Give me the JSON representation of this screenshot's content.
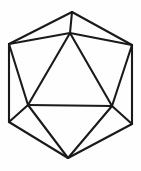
{
  "figure": {
    "name": "icosahedron-wireframe",
    "shape_type": "polyhedron-wireframe",
    "background_color": "#fefefe",
    "line_color": "#1a1a1a",
    "line_width": 2.1,
    "canvas": {
      "width": 141,
      "height": 171
    },
    "vertices": [
      {
        "id": "top-apex",
        "label": "top apex",
        "x": 72,
        "y": 12
      },
      {
        "id": "inner-top",
        "label": "inner top",
        "x": 70,
        "y": 33
      },
      {
        "id": "hex-top-left",
        "label": "hexagon top left",
        "x": 9,
        "y": 44
      },
      {
        "id": "hex-top-right",
        "label": "hexagon top right",
        "x": 132,
        "y": 45
      },
      {
        "id": "inner-left",
        "label": "inner left",
        "x": 28,
        "y": 105
      },
      {
        "id": "inner-right",
        "label": "inner right",
        "x": 112,
        "y": 106
      },
      {
        "id": "hex-bot-left",
        "label": "hexagon bottom left",
        "x": 9,
        "y": 122
      },
      {
        "id": "hex-bot-right",
        "label": "hexagon bottom right",
        "x": 132,
        "y": 124
      },
      {
        "id": "bottom-apex",
        "label": "bottom apex",
        "x": 68,
        "y": 158
      }
    ],
    "edges": [
      {
        "id": "outline-top-left",
        "from": "top-apex",
        "to": "hex-top-left"
      },
      {
        "id": "outline-top-right",
        "from": "top-apex",
        "to": "hex-top-right"
      },
      {
        "id": "outline-left",
        "from": "hex-top-left",
        "to": "hex-bot-left"
      },
      {
        "id": "outline-right",
        "from": "hex-top-right",
        "to": "hex-bot-right"
      },
      {
        "id": "outline-bottom-left",
        "from": "hex-bot-left",
        "to": "bottom-apex"
      },
      {
        "id": "outline-bottom-right",
        "from": "hex-bot-right",
        "to": "bottom-apex"
      },
      {
        "id": "spoke-apex-inner-top",
        "from": "top-apex",
        "to": "inner-top"
      },
      {
        "id": "spoke-inner-top-left",
        "from": "inner-top",
        "to": "hex-top-left"
      },
      {
        "id": "spoke-inner-top-right",
        "from": "inner-top",
        "to": "hex-top-right"
      },
      {
        "id": "triangle-left-side",
        "from": "inner-top",
        "to": "inner-left"
      },
      {
        "id": "triangle-right-side",
        "from": "inner-top",
        "to": "inner-right"
      },
      {
        "id": "triangle-base",
        "from": "inner-left",
        "to": "inner-right"
      },
      {
        "id": "spoke-inner-left-up",
        "from": "inner-left",
        "to": "hex-top-left"
      },
      {
        "id": "spoke-inner-left-down",
        "from": "inner-left",
        "to": "hex-bot-left"
      },
      {
        "id": "spoke-inner-left-apex",
        "from": "inner-left",
        "to": "bottom-apex"
      },
      {
        "id": "spoke-inner-right-up",
        "from": "inner-right",
        "to": "hex-top-right"
      },
      {
        "id": "spoke-inner-right-down",
        "from": "inner-right",
        "to": "hex-bot-right"
      },
      {
        "id": "spoke-inner-right-apex",
        "from": "inner-right",
        "to": "bottom-apex"
      }
    ]
  }
}
